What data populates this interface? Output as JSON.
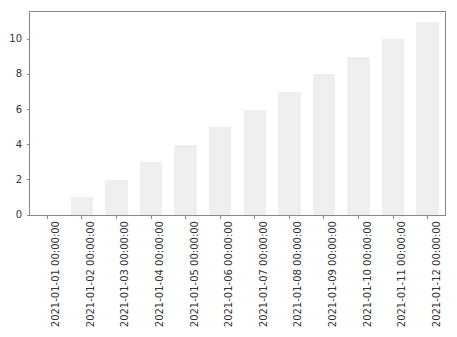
{
  "chart_data": {
    "type": "bar",
    "title": "",
    "subtitle": "",
    "xlabel": "",
    "ylabel": "",
    "categories": [
      "2021-01-01 00:00:00",
      "2021-01-02 00:00:00",
      "2021-01-03 00:00:00",
      "2021-01-04 00:00:00",
      "2021-01-05 00:00:00",
      "2021-01-06 00:00:00",
      "2021-01-07 00:00:00",
      "2021-01-08 00:00:00",
      "2021-01-09 00:00:00",
      "2021-01-10 00:00:00",
      "2021-01-11 00:00:00",
      "2021-01-12 00:00:00"
    ],
    "values": [
      0,
      1,
      2,
      3,
      4,
      5,
      6,
      7,
      8,
      9,
      10,
      11
    ],
    "xlim": [
      -0.5,
      11.5
    ],
    "ylim": [
      0,
      11.55
    ],
    "yticks": [
      0,
      2,
      4,
      6,
      8,
      10
    ],
    "ytick_labels": [
      "0",
      "2",
      "4",
      "6",
      "8",
      "10"
    ],
    "grid": false,
    "legend": null,
    "legend_position": "none",
    "bar_color": "#efefef",
    "axis_color": "#888888",
    "tick_label_color": "#333333",
    "background_color": "#ffffff",
    "xtick_rotation": 90,
    "bar_width_ratio": 0.65
  }
}
